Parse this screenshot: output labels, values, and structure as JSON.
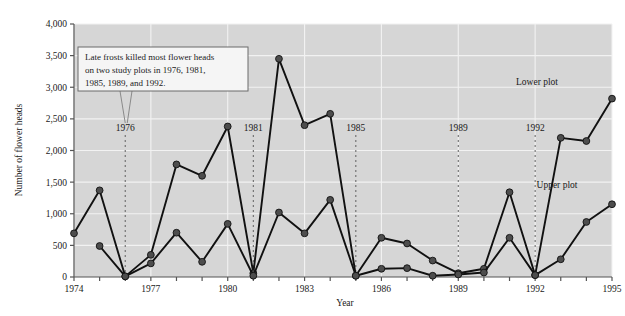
{
  "chart_data": {
    "type": "line",
    "title": "",
    "xlabel": "Year",
    "ylabel": "Number of flower heads",
    "xlim": [
      1974,
      1995
    ],
    "ylim": [
      0,
      4000
    ],
    "ytick_values": [
      0,
      500,
      1000,
      1500,
      2000,
      2500,
      3000,
      3500,
      4000
    ],
    "ytick_labels": [
      "0",
      "500",
      "1,000",
      "1,500",
      "2,000",
      "2,500",
      "3,000",
      "3,500",
      "4,000"
    ],
    "xtick_values": [
      1974,
      1975,
      1976,
      1977,
      1978,
      1979,
      1980,
      1981,
      1982,
      1983,
      1984,
      1985,
      1986,
      1987,
      1988,
      1989,
      1990,
      1991,
      1992,
      1993,
      1994,
      1995
    ],
    "xtick_labels_shown": [
      "1974",
      "1977",
      "1980",
      "1983",
      "1986",
      "1989",
      "1992",
      "1995"
    ],
    "grid": true,
    "grid_color": "#f2f2f2",
    "plot_background": "#d6d6d6",
    "line_color": "#111111",
    "marker_color": "#4d4d4d",
    "legend_position": "inline-labels",
    "x": [
      1974,
      1975,
      1976,
      1977,
      1978,
      1979,
      1980,
      1981,
      1982,
      1983,
      1984,
      1985,
      1986,
      1987,
      1988,
      1989,
      1990,
      1991,
      1992,
      1993,
      1994,
      1995
    ],
    "series": [
      {
        "name": "Lower plot",
        "label": "Lower plot",
        "values": [
          690,
          1370,
          10,
          350,
          1780,
          1600,
          2380,
          60,
          3450,
          2400,
          2580,
          20,
          620,
          530,
          260,
          60,
          130,
          1340,
          30,
          2200,
          2150,
          2820
        ]
      },
      {
        "name": "Upper plot",
        "label": "Upper plot",
        "values": [
          null,
          490,
          10,
          215,
          700,
          240,
          840,
          20,
          1020,
          690,
          1220,
          20,
          130,
          140,
          20,
          40,
          70,
          620,
          30,
          280,
          870,
          1150
        ]
      }
    ],
    "event_lines": [
      {
        "year": 1976,
        "label": "1976"
      },
      {
        "year": 1981,
        "label": "1981"
      },
      {
        "year": 1985,
        "label": "1985"
      },
      {
        "year": 1989,
        "label": "1989"
      },
      {
        "year": 1992,
        "label": "1992"
      }
    ],
    "annotations": [
      {
        "id": "frost-note",
        "lines": [
          "Late frosts killed most flower heads",
          "on two study plots in 1976, 1981,",
          "1985, 1989, and 1992."
        ],
        "points_to_year": 1976
      }
    ]
  }
}
